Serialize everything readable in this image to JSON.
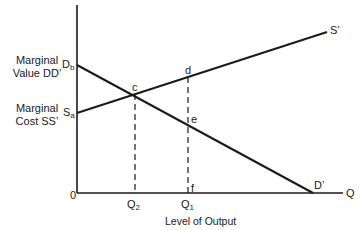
{
  "diagram": {
    "type": "economics-supply-demand",
    "y_axis_labels": {
      "marginal_value_line1": "Marginal",
      "marginal_value_line2": "Value DD’",
      "marginal_cost_line1": "Marginal",
      "marginal_cost_line2": "Cost SS’"
    },
    "intercepts": {
      "demand": {
        "base": "D",
        "sub": "b"
      },
      "supply": {
        "base": "S",
        "sub": "a"
      }
    },
    "curve_end_labels": {
      "supply_end": "S’",
      "demand_end": "D’"
    },
    "points": {
      "c": "c",
      "d": "d",
      "e": "e",
      "f": "f"
    },
    "x_axis": {
      "origin": "0",
      "end": "Q",
      "q2": {
        "base": "Q",
        "sub": "2"
      },
      "q1": {
        "base": "Q",
        "sub": "1"
      },
      "title": "Level of Output"
    },
    "colors": {
      "line": "#1a1a1a",
      "background": "#ffffff"
    }
  }
}
